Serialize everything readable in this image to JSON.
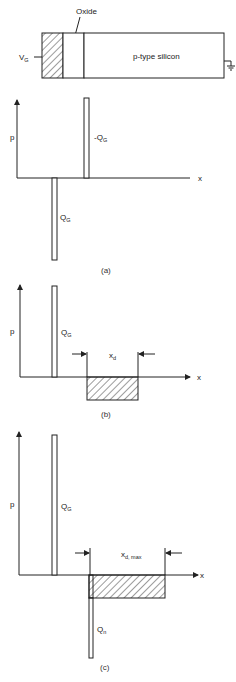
{
  "device": {
    "oxide_label": "Oxide",
    "gate_label": "V",
    "gate_sub": "G",
    "silicon_label": "p-type silicon"
  },
  "panels": [
    {
      "caption": "(a)",
      "y_label": "p",
      "x_label": "x",
      "labels": {
        "top_bar": "-Q",
        "top_bar_sub": "G",
        "bottom_bar": "Q",
        "bottom_bar_sub": "G"
      }
    },
    {
      "caption": "(b)",
      "y_label": "p",
      "x_label": "x",
      "labels": {
        "gate_bar": "Q",
        "gate_bar_sub": "G",
        "width": "x",
        "width_sub": "d"
      }
    },
    {
      "caption": "(c)",
      "y_label": "p",
      "x_label": "x",
      "labels": {
        "gate_bar": "Q",
        "gate_bar_sub": "G",
        "width": "x",
        "width_sub": "d, max",
        "inversion_bar": "Q",
        "inversion_bar_sub": "n"
      }
    }
  ],
  "colors": {
    "ink": "#222222",
    "background": "#ffffff"
  }
}
